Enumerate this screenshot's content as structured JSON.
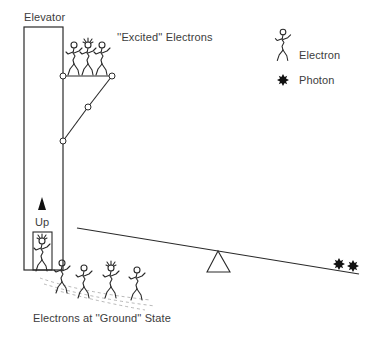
{
  "diagram": {
    "labels": {
      "elevator": "Elevator",
      "excited": "''Excited'' Electrons",
      "up": "Up",
      "ground": "Electrons at ''Ground'' State"
    },
    "legend": [
      {
        "icon": "electron-stick-figure-icon",
        "label": "Electron"
      },
      {
        "icon": "photon-starburst-icon",
        "label": "Photon"
      }
    ],
    "elements": {
      "elevator_shaft": "tall rectangle",
      "elevator_cabin": "small box with one electron, arrow up",
      "scissor_lift": "platform with hinged arms carrying 3 excited electrons",
      "seesaw": "long plank tilted down to the right on triangular fulcrum",
      "photons_on_seesaw": 2,
      "excited_electron_count": 3,
      "ground_electron_count": 4
    },
    "colors": {
      "ink": "#2a2a2a",
      "text": "#3c3c3c",
      "background": "#ffffff"
    }
  }
}
